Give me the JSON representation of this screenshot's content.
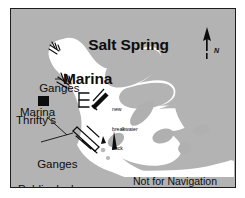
{
  "map": {
    "title_line1": "Salt Spring",
    "title_line2": "Marina",
    "labels": {
      "ganges_marina_line1": "Ganges",
      "ganges_marina_line2": "Marina",
      "thriftys": "Thrifty's",
      "ganges_public_line1": "Ganges",
      "ganges_public_line2": "Public docks",
      "breakwater_line1": "new",
      "breakwater_line2": "breakwater",
      "breakwater_line3": "dock",
      "disclaimer": "Not for Navigation",
      "north": "N"
    },
    "colors": {
      "land": "#b3b3b3",
      "water": "#ffffff",
      "ink": "#0d0d0d",
      "border": "#1d1d1d",
      "rock": "#b0b0b0",
      "page": "#ffffff"
    },
    "features": {
      "thriftys_marker": "black-square",
      "north_arrow": "north-arrow-icon",
      "marina_dock_symbol": "dock-symbol",
      "ganges_marina_dock_symbol": "dock-symbol",
      "comb_dock_symbol": "comb-dock-symbol",
      "breakwater_dock_symbol": "breakwater-dock-symbol",
      "public_dock_symbol": "public-dock-symbol"
    }
  }
}
